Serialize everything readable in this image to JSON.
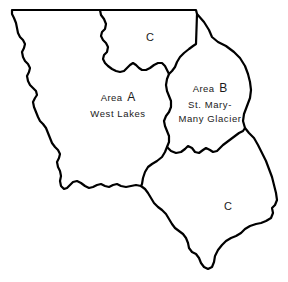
{
  "figure": {
    "name": "glacier-national-park-area-map",
    "background_color": "#ffffff",
    "line_color": "#000000"
  },
  "regions": [
    {
      "id": "area-c-north",
      "label_lines": [
        "C"
      ],
      "label_x": 150,
      "label_y": 38,
      "style": "single"
    },
    {
      "id": "area-a-west-lakes",
      "area_word": "Area",
      "area_letter": "A",
      "label_lines": [
        "Area  A",
        "West Lakes"
      ],
      "sub_label": "West Lakes",
      "label_x": 118,
      "label_y": 105,
      "style": "multi"
    },
    {
      "id": "area-b-st-mary-many-glacier",
      "area_word": "Area",
      "area_letter": "B",
      "label_lines": [
        "Area  B",
        "St. Mary-",
        "Many Glacier"
      ],
      "sub_label_1": "St. Mary-",
      "sub_label_2": "Many Glacier",
      "label_x": 210,
      "label_y": 103,
      "style": "multi"
    },
    {
      "id": "area-c-south",
      "label_lines": [
        "C"
      ],
      "label_x": 228,
      "label_y": 207,
      "style": "single"
    }
  ],
  "paths": {
    "park_outline": "M 12,10 L 196,10 L 197,14 L 204,22 L 209,30 L 212,37 L 218,42 L 226,46 L 234,52 L 240,58 L 245,66 L 248,74 L 250,82 L 251,90 L 250,98 L 247,106 L 244,114 L 243,121 L 245,128 L 249,133 L 254,138 L 258,145 L 262,153 L 266,161 L 269,169 L 272,177 L 274,185 L 276,193 L 277,200 L 275,205 L 272,208 L 273,213 L 271,218 L 266,221 L 261,223 L 256,224 L 250,226 L 245,229 L 241,233 L 236,236 L 231,238 L 226,241 L 222,245 L 218,250 L 215,256 L 214,262 L 212,267 L 208,269 L 204,267 L 201,263 L 199,258 L 196,254 L 192,252 L 189,248 L 188,243 L 186,238 L 183,234 L 179,231 L 175,228 L 172,224 L 169,219 L 166,214 L 162,210 L 158,207 L 154,203 L 151,198 L 148,193 L 145,189 L 141,186 L 136,185 L 131,186 L 126,187 L 121,186 L 117,184 L 113,185 L 109,187 L 105,186 L 101,184 L 97,185 L 93,187 L 89,188 L 85,186 L 81,183 L 77,181 L 73,182 L 70,185 L 67,188 L 64,189 L 61,186 L 60,181 L 61,176 L 60,171 L 58,167 L 57,162 L 59,158 L 60,154 L 58,150 L 55,147 L 52,143 L 50,138 L 48,133 L 46,128 L 43,124 L 40,121 L 38,117 L 36,112 L 34,107 L 33,102 L 35,98 L 37,95 L 36,91 L 33,88 L 30,85 L 28,81 L 27,76 L 29,72 L 30,68 L 28,64 L 25,61 L 23,57 L 22,52 L 24,48 L 25,44 L 23,40 L 20,37 L 18,33 L 17,28 L 16,23 L 14,18 L 12,14 Z",
    "divider_north_c": "M 100,10 L 101,15 L 104,19 L 106,24 L 105,29 L 102,32 L 101,36 L 103,40 L 106,43 L 108,47 L 107,52 L 104,55 L 103,59 L 105,63 L 108,66 L 112,69 L 116,71 L 120,72 L 124,71 L 127,68 L 130,65 L 133,63 L 136,65 L 139,68 L 142,70 L 146,70 L 150,68 L 154,65 L 158,63 L 162,63 L 165,66 L 167,70 L 169,74 L 172,71 L 175,67 L 177,62 L 180,57 L 184,53 L 189,49 L 193,46 L 196,44 L 197,14",
    "divider_a_b": "M 169,74 L 167,79 L 166,85 L 167,91 L 169,96 L 171,101 L 171,107 L 169,112 L 166,116 L 164,121 L 165,126 L 167,131 L 169,136 L 169,142 L 167,147 L 165,152 L 162,157 L 157,161 L 152,164 L 148,167 L 145,172 L 143,178 L 142,184 L 141,186",
    "divider_b_south_c": "M 167,147 L 171,151 L 176,153 L 181,152 L 185,149 L 188,146 L 192,148 L 195,152 L 199,153 L 203,150 L 206,148 L 210,150 L 213,152 L 217,151 L 220,148 L 223,145 L 227,142 L 231,139 L 235,136 L 239,133 L 243,131 L 245,128"
  }
}
